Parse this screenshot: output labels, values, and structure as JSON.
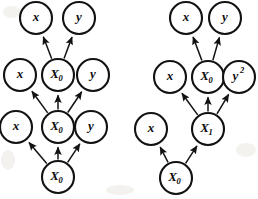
{
  "figure": {
    "title": "",
    "type": "directed-graph-pair",
    "background_color": "#ffffff",
    "stroke_color": "#121212",
    "node_fill": "#ffffff",
    "node_radius": 16
  },
  "graphs": [
    {
      "id": "left-graph",
      "name": "left-unrolled-graph",
      "nodes": [
        {
          "id": "L-t3-x",
          "label": "x",
          "sub": "",
          "sup": "",
          "cx": 36,
          "cy": 18
        },
        {
          "id": "L-t3-y",
          "label": "y",
          "sub": "",
          "sup": "",
          "cx": 79,
          "cy": 18
        },
        {
          "id": "L-t2-x",
          "label": "x",
          "sub": "",
          "sup": "",
          "cx": 20,
          "cy": 75
        },
        {
          "id": "L-t2-X",
          "label": "X",
          "sub": "0",
          "sup": "",
          "cx": 58,
          "cy": 75
        },
        {
          "id": "L-t2-y",
          "label": "y",
          "sub": "",
          "sup": "",
          "cx": 93,
          "cy": 75
        },
        {
          "id": "L-t1-x",
          "label": "x",
          "sub": "",
          "sup": "",
          "cx": 16,
          "cy": 127
        },
        {
          "id": "L-t1-X",
          "label": "X",
          "sub": "0",
          "sup": "",
          "cx": 58,
          "cy": 127
        },
        {
          "id": "L-t1-y",
          "label": "y",
          "sub": "",
          "sup": "",
          "cx": 91,
          "cy": 127
        },
        {
          "id": "L-t0-X",
          "label": "X",
          "sub": "0",
          "sup": "",
          "cx": 58,
          "cy": 177
        }
      ],
      "edges": [
        {
          "from": "L-t2-X",
          "to": "L-t3-x"
        },
        {
          "from": "L-t2-X",
          "to": "L-t3-y"
        },
        {
          "from": "L-t1-X",
          "to": "L-t2-x"
        },
        {
          "from": "L-t1-X",
          "to": "L-t2-X"
        },
        {
          "from": "L-t1-X",
          "to": "L-t2-y"
        },
        {
          "from": "L-t0-X",
          "to": "L-t1-x"
        },
        {
          "from": "L-t0-X",
          "to": "L-t1-X"
        },
        {
          "from": "L-t0-X",
          "to": "L-t1-y"
        }
      ]
    },
    {
      "id": "right-graph",
      "name": "right-unrolled-graph",
      "nodes": [
        {
          "id": "R-t3-x",
          "label": "x",
          "sub": "",
          "sup": "",
          "cx": 186,
          "cy": 18
        },
        {
          "id": "R-t3-y",
          "label": "y",
          "sub": "",
          "sup": "",
          "cx": 225,
          "cy": 18
        },
        {
          "id": "R-t2-x",
          "label": "x",
          "sub": "",
          "sup": "",
          "cx": 170,
          "cy": 77
        },
        {
          "id": "R-t2-X",
          "label": "X",
          "sub": "0",
          "sup": "",
          "cx": 208,
          "cy": 77
        },
        {
          "id": "R-t2-y2",
          "label": "y",
          "sub": "",
          "sup": "2",
          "cx": 239,
          "cy": 77
        },
        {
          "id": "R-t1-x",
          "label": "x",
          "sub": "",
          "sup": "",
          "cx": 151,
          "cy": 129
        },
        {
          "id": "R-t1-X",
          "label": "X",
          "sub": "1",
          "sup": "",
          "cx": 208,
          "cy": 129
        },
        {
          "id": "R-t0-X",
          "label": "X",
          "sub": "0",
          "sup": "",
          "cx": 176,
          "cy": 178
        }
      ],
      "edges": [
        {
          "from": "R-t2-X",
          "to": "R-t3-x"
        },
        {
          "from": "R-t2-X",
          "to": "R-t3-y"
        },
        {
          "from": "R-t1-X",
          "to": "R-t2-x"
        },
        {
          "from": "R-t1-X",
          "to": "R-t2-X"
        },
        {
          "from": "R-t1-X",
          "to": "R-t2-y2"
        },
        {
          "from": "R-t0-X",
          "to": "R-t1-x"
        },
        {
          "from": "R-t0-X",
          "to": "R-t1-X"
        }
      ]
    }
  ]
}
